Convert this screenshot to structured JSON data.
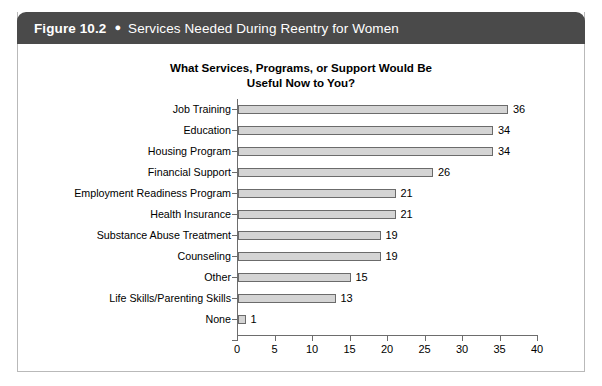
{
  "figure": {
    "number": "Figure 10.2",
    "bullet": "●",
    "caption": "Services Needed During Reentry for Women",
    "header_bg": "#4a4a4a",
    "header_text_color": "#ffffff",
    "border_color": "#b9b9b9"
  },
  "chart_data": {
    "type": "bar",
    "orientation": "horizontal",
    "title": "What Services, Programs, or Support Would Be Useful Now to You?",
    "title_lines": [
      "What Services, Programs, or Support Would Be",
      "Useful Now to You?"
    ],
    "xlabel": "",
    "ylabel": "",
    "categories": [
      "Job Training",
      "Education",
      "Housing Program",
      "Financial Support",
      "Employment Readiness Program",
      "Health Insurance",
      "Substance Abuse Treatment",
      "Counseling",
      "Other",
      "Life Skills/Parenting Skills",
      "None"
    ],
    "values": [
      36,
      34,
      34,
      26,
      21,
      21,
      19,
      19,
      15,
      13,
      1
    ],
    "data_labels": [
      "36",
      "34",
      "34",
      "26",
      "21",
      "21",
      "19",
      "19",
      "15",
      "13",
      "1"
    ],
    "xlim": [
      0,
      40
    ],
    "xticks": [
      0,
      5,
      10,
      15,
      20,
      25,
      30,
      35,
      40
    ],
    "xtick_labels": [
      "0",
      "5",
      "10",
      "15",
      "20",
      "25",
      "30",
      "35",
      "40"
    ],
    "grid": false,
    "legend": false,
    "bar_fill": "#d4d4d4",
    "bar_border": "#6b6b6b",
    "axis_color": "#6d6d6d"
  }
}
